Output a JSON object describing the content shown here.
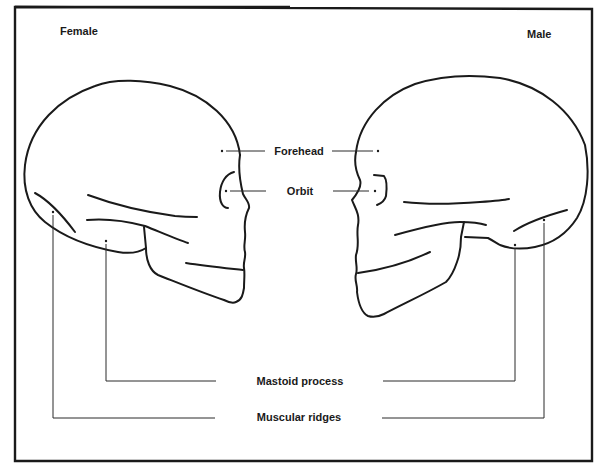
{
  "diagram": {
    "type": "comparative anatomical line drawing",
    "colors": {
      "line": "#1a1a1a",
      "background": "#ffffff"
    },
    "panels": {
      "left": {
        "title": "Female",
        "facing": "right"
      },
      "right": {
        "title": "Male",
        "facing": "left"
      }
    },
    "labels": [
      {
        "id": "forehead",
        "text": "Forehead"
      },
      {
        "id": "orbit",
        "text": "Orbit"
      },
      {
        "id": "mastoid",
        "text": "Mastoid process"
      },
      {
        "id": "ridges",
        "text": "Muscular ridges"
      }
    ]
  }
}
